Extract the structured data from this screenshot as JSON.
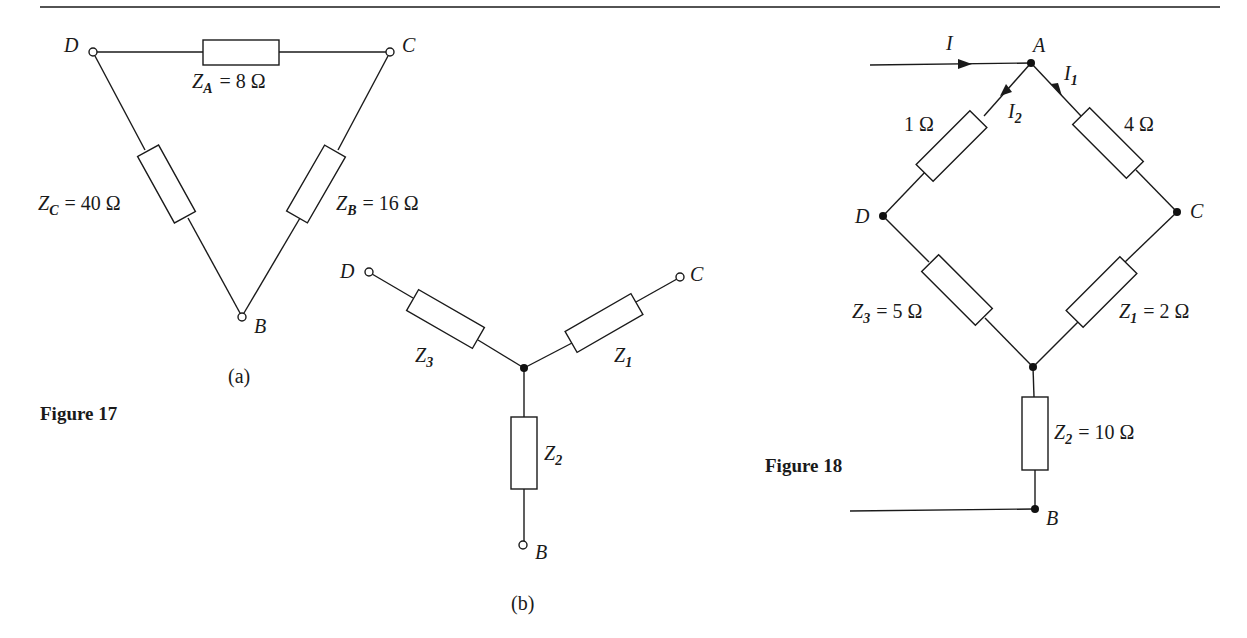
{
  "figure17": {
    "caption": "Figure 17",
    "part_a": {
      "label": "(a)",
      "type": "delta",
      "nodes": {
        "D": "D",
        "C": "C",
        "B": "B"
      },
      "impedances": [
        {
          "name": "Z",
          "sub": "A",
          "value": "= 8 Ω",
          "between": [
            "D",
            "C"
          ]
        },
        {
          "name": "Z",
          "sub": "B",
          "value": "= 16 Ω",
          "between": [
            "C",
            "B"
          ]
        },
        {
          "name": "Z",
          "sub": "C",
          "value": "= 40 Ω",
          "between": [
            "D",
            "B"
          ]
        }
      ]
    },
    "part_b": {
      "label": "(b)",
      "type": "star",
      "nodes": {
        "D": "D",
        "C": "C",
        "B": "B"
      },
      "impedances": [
        {
          "name": "Z",
          "sub": "1",
          "between": [
            "center",
            "C"
          ]
        },
        {
          "name": "Z",
          "sub": "2",
          "between": [
            "center",
            "B"
          ]
        },
        {
          "name": "Z",
          "sub": "3",
          "between": [
            "center",
            "D"
          ]
        }
      ]
    }
  },
  "figure18": {
    "caption": "Figure 18",
    "nodes": {
      "A": "A",
      "B": "B",
      "C": "C",
      "D": "D"
    },
    "currents": [
      {
        "name": "I",
        "sub": "",
        "direction": "into A"
      },
      {
        "name": "I",
        "sub": "1",
        "direction": "A to C"
      },
      {
        "name": "I",
        "sub": "2",
        "direction": "A to D"
      }
    ],
    "resistors": [
      {
        "label": "1 Ω",
        "between": [
          "A",
          "D"
        ]
      },
      {
        "label": "4 Ω",
        "between": [
          "A",
          "C"
        ]
      },
      {
        "name": "Z",
        "sub": "3",
        "value": "= 5 Ω",
        "between": [
          "D",
          "star"
        ]
      },
      {
        "name": "Z",
        "sub": "1",
        "value": "= 2 Ω",
        "between": [
          "C",
          "star"
        ]
      },
      {
        "name": "Z",
        "sub": "2",
        "value": "= 10 Ω",
        "between": [
          "star",
          "B"
        ]
      }
    ]
  }
}
